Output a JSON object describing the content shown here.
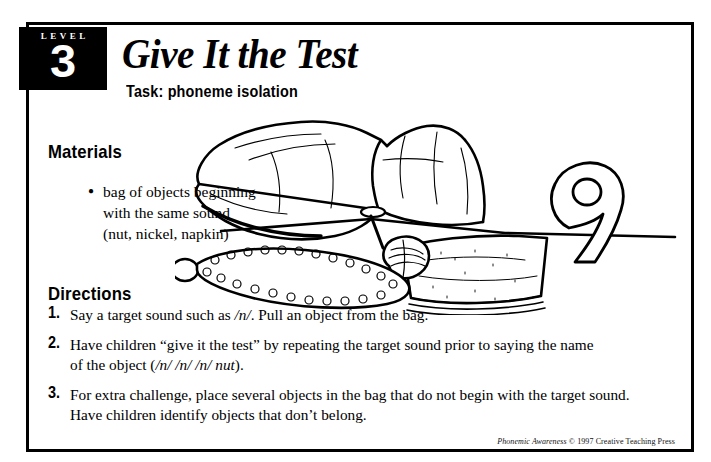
{
  "badge": {
    "level_label": "LEVEL",
    "level_number": "3"
  },
  "header": {
    "title": "Give It the Test",
    "subtitle": "Task: phoneme isolation"
  },
  "materials": {
    "heading": "Materials",
    "items": [
      {
        "line1": "bag of objects beginning",
        "line2": "with the same sound",
        "line3": "(nut, nickel, napkin)"
      }
    ]
  },
  "directions": {
    "heading": "Directions",
    "steps": [
      {
        "number": "1.",
        "line1_a": "Say a target sound such as ",
        "line1_i": "/n/",
        "line1_b": ". Pull an object from the bag."
      },
      {
        "number": "2.",
        "line1": "Have children “give it the test” by repeating the target sound prior to saying the name",
        "line2_a": "of the object (",
        "line2_i": "/n/ /n/ /n/ nut",
        "line2_b": ")."
      },
      {
        "number": "3.",
        "line1": "For extra challenge, place several objects in the bag that do not begin with the target sound.",
        "line2": "Have children identify objects that don’t belong."
      }
    ]
  },
  "footer": {
    "title_italic": "Phonemic Awareness",
    "rest": " © 1997 Creative Teaching Press"
  },
  "illustration": {
    "description": "line drawing of a paper bag on a table with a nail, a nickel, a necklace, a napkin, a nut and the numeral 9",
    "objects": [
      "paper-bag",
      "nail",
      "nickel-coin",
      "necklace-chain",
      "napkin",
      "walnut-nut",
      "numeral-nine",
      "table-edge"
    ]
  },
  "colors": {
    "ink": "#000000",
    "page": "#ffffff"
  }
}
